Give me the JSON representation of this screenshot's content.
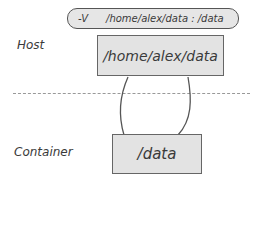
{
  "diagram": {
    "command": {
      "flag": "-V",
      "mapping": "/home/alex/data : /data"
    },
    "host": {
      "label": "Host",
      "path": "/home/alex/data"
    },
    "container": {
      "label": "Container",
      "path": "/data"
    },
    "colors": {
      "box_fill": "#e3e3e3",
      "stroke": "#555555",
      "divider": "#999999"
    }
  }
}
